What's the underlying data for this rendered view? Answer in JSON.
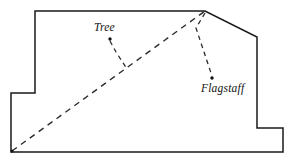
{
  "figure": {
    "title": "",
    "background_color": "#ffffff",
    "line_color": "#1a1a1a",
    "dash_color": "#2b2b2b",
    "width": 294,
    "height": 163
  },
  "labels": {
    "tree": "Tree",
    "flagstaff": "Flagstaff"
  },
  "geometry": {
    "outline_points": "35,11 205,11 257,37 257,128 283,128 283,152 11,152 11,93 35,93",
    "sight_line_points": "12,151 205,11",
    "tree_leader_points": "110,41 116,52 127,69",
    "flagstaff_leader_points": "205,13 196,28 212,76",
    "tree_dot": {
      "cx": 110,
      "cy": 39,
      "r": 1.7
    },
    "flagstaff_dot": {
      "cx": 212,
      "cy": 78,
      "r": 1.7
    },
    "origin_dot": {
      "cx": 12,
      "cy": 151,
      "r": 1.5
    }
  }
}
